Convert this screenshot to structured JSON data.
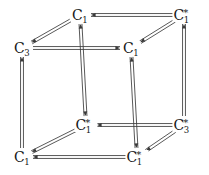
{
  "diagram": {
    "kind": "commutative-cube",
    "width": 209,
    "height": 175,
    "stroke_color": "#3a3a3a",
    "text_color": "#171717",
    "background": "#ffffff",
    "edge_style": "double-line-with-arrowheads",
    "nodes": [
      {
        "id": "back-top-left",
        "base": "C",
        "sub": "3",
        "star": "",
        "label": "C3",
        "x": 22,
        "y": 48
      },
      {
        "id": "front-top-left",
        "base": "C",
        "sub": "1",
        "star": "",
        "label": "C1",
        "x": 80,
        "y": 15
      },
      {
        "id": "back-top-right",
        "base": "C",
        "sub": "1",
        "star": "",
        "label": "C1",
        "x": 131,
        "y": 48
      },
      {
        "id": "front-top-right",
        "base": "C",
        "sub": "1",
        "star": "*",
        "label": "C1*",
        "x": 184,
        "y": 15
      },
      {
        "id": "back-bottom-left",
        "base": "C",
        "sub": "1",
        "star": "",
        "label": "C1",
        "x": 22,
        "y": 157
      },
      {
        "id": "front-bottom-left",
        "base": "C",
        "sub": "1",
        "star": "*",
        "label": "C1*",
        "x": 86,
        "y": 125
      },
      {
        "id": "back-bottom-right",
        "base": "C",
        "sub": "1",
        "star": "*",
        "label": "C1*",
        "x": 137,
        "y": 157
      },
      {
        "id": "front-bottom-right",
        "base": "C",
        "sub": "3",
        "star": "*",
        "label": "C3*",
        "x": 184,
        "y": 125
      }
    ],
    "edges": [
      {
        "id": "top-front-horizontal",
        "from": "front-top-right",
        "to": "front-top-left",
        "orientation": "horizontal",
        "arrow": "to"
      },
      {
        "id": "top-back-horizontal",
        "from": "back-top-left",
        "to": "back-top-right",
        "orientation": "horizontal",
        "arrow": "to"
      },
      {
        "id": "bottom-back-horizontal",
        "from": "front-bottom-right",
        "to": "front-bottom-left",
        "orientation": "horizontal",
        "arrow": "to"
      },
      {
        "id": "bottom-front-horizontal",
        "from": "back-bottom-right",
        "to": "back-bottom-left",
        "orientation": "horizontal",
        "arrow": "to"
      },
      {
        "id": "left-back-vertical",
        "from": "back-bottom-left",
        "to": "back-top-left",
        "orientation": "vertical",
        "arrow": "to"
      },
      {
        "id": "left-front-vertical",
        "from": "front-top-left",
        "to": "front-bottom-left",
        "orientation": "vertical",
        "arrow": "both"
      },
      {
        "id": "right-back-vertical",
        "from": "back-bottom-right",
        "to": "back-top-right",
        "orientation": "vertical",
        "arrow": "both"
      },
      {
        "id": "right-front-vertical",
        "from": "front-bottom-right",
        "to": "front-top-right",
        "orientation": "vertical",
        "arrow": "to"
      },
      {
        "id": "diag-top-left",
        "from": "front-top-left",
        "to": "back-top-left",
        "orientation": "diagonal",
        "arrow": "to"
      },
      {
        "id": "diag-top-right",
        "from": "front-top-right",
        "to": "back-top-right",
        "orientation": "diagonal",
        "arrow": "to"
      },
      {
        "id": "diag-bottom-left",
        "from": "front-bottom-left",
        "to": "back-bottom-left",
        "orientation": "diagonal",
        "arrow": "to"
      },
      {
        "id": "diag-bottom-right",
        "from": "front-bottom-right",
        "to": "back-bottom-right",
        "orientation": "diagonal",
        "arrow": "to"
      }
    ]
  }
}
